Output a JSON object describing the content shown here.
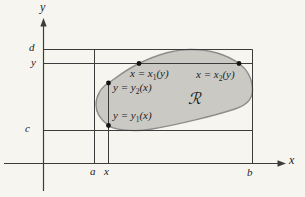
{
  "figure": {
    "region_symbol": "ℛ",
    "colors": {
      "background": "#f6f5f0",
      "region_fill": "#cac9c4",
      "region_stroke": "#8d8d8b",
      "line": "#3c3c3c",
      "dot": "#141414",
      "text": "#222222"
    }
  },
  "axes": {
    "x_label": "x",
    "y_label": "y"
  },
  "ticks": {
    "a": "a",
    "x": "x",
    "b": "b",
    "c": "c",
    "y": "y",
    "d": "d"
  },
  "curve_labels": {
    "x1": {
      "pre": "x = x",
      "sub": "1",
      "post": "(y)"
    },
    "x2": {
      "pre": "x = x",
      "sub": "2",
      "post": "(y)"
    },
    "y2": {
      "pre": "y = y",
      "sub": "2",
      "post": "(x)"
    },
    "y1": {
      "pre": "y = y",
      "sub": "1",
      "post": "(x)"
    }
  }
}
